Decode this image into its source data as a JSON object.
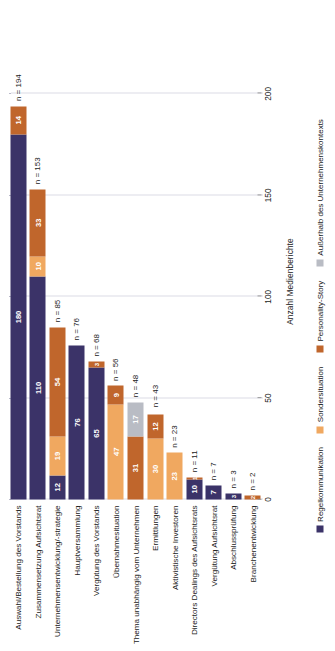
{
  "chart_data": {
    "type": "bar",
    "orientation": "horizontal-stacked",
    "title": "",
    "xlabel": "Anzahl Medienberichte",
    "ylabel": "",
    "xlim": [
      0,
      215
    ],
    "xticks": [
      0,
      50,
      100,
      150,
      200
    ],
    "grid": true,
    "legend_position": "bottom",
    "categories": [
      "Auswahl/Bestellung des Vorstands",
      "Zusammensetzung Aufsichtsrat",
      "Unternehmensentwicklung/-strategie",
      "Hauptversammlung",
      "Vergütung des Vorstands",
      "Übernahmesituation",
      "Thema unabhängig vom Unternehmen",
      "Ermittlungen",
      "Aktivistische Investoren",
      "Directors Dealings des Aufsichtsrats",
      "Vergütung Aufsichtsrat",
      "Abschlussprüfung",
      "Branchenentwicklung"
    ],
    "series": [
      {
        "name": "Regelkommunikation",
        "color": "#3b3368",
        "values": [
          180,
          110,
          12,
          76,
          65,
          0,
          0,
          0,
          0,
          10,
          7,
          3,
          0
        ]
      },
      {
        "name": "Sondersituation",
        "color": "#f0a860",
        "values": [
          0,
          10,
          19,
          0,
          0,
          47,
          0,
          30,
          23,
          0,
          0,
          0,
          0
        ]
      },
      {
        "name": "Personality-Story",
        "color": "#c0662c",
        "values": [
          14,
          33,
          54,
          0,
          3,
          9,
          31,
          12,
          0,
          1,
          0,
          0,
          2
        ]
      },
      {
        "name": "Außerhalb des Unternehmenskontexts",
        "color": "#b9bcc4",
        "values": [
          0,
          0,
          0,
          0,
          0,
          0,
          17,
          0,
          0,
          0,
          0,
          0,
          0
        ]
      }
    ],
    "totals": [
      194,
      153,
      85,
      76,
      68,
      56,
      48,
      43,
      23,
      11,
      7,
      3,
      2
    ],
    "total_labels": [
      "n = 194",
      "n = 153",
      "n = 85",
      "n = 76",
      "n = 68",
      "n = 56",
      "n = 48",
      "n = 43",
      "n = 23",
      "n = 11",
      "n = 7",
      "n = 3",
      "n = 2"
    ],
    "tick_labels": [
      "0",
      "50",
      "100",
      "150",
      "200"
    ]
  },
  "legend": {
    "items": [
      {
        "label": "Regelkommunikation",
        "color": "#3b3368"
      },
      {
        "label": "Sondersituation",
        "color": "#f0a860"
      },
      {
        "label": "Personality-Story",
        "color": "#c0662c"
      },
      {
        "label": "Außerhalb des Unternehmenskontexts",
        "color": "#b9bcc4"
      }
    ]
  }
}
